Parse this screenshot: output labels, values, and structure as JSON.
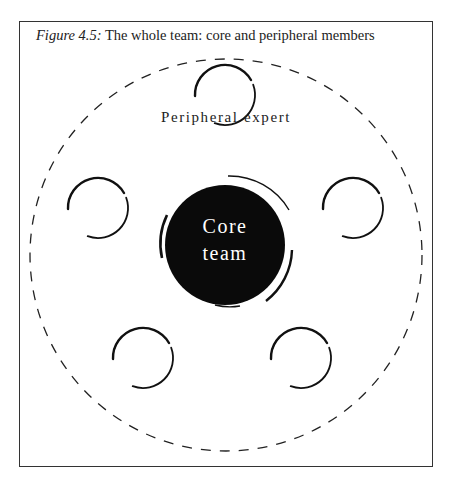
{
  "figure": {
    "caption_label": "Figure 4.5:",
    "caption_text": " The whole team: core and peripheral members"
  },
  "diagram": {
    "outer_boundary": {
      "style": "dashed",
      "meaning": "whole team"
    },
    "core": {
      "line1": "Core",
      "line2": "team",
      "fill": "#0a0a0a",
      "text_color": "#ffffff"
    },
    "peripheral_label": "Peripheral expert",
    "peripheral_count": 5,
    "stroke_color": "#111111"
  }
}
